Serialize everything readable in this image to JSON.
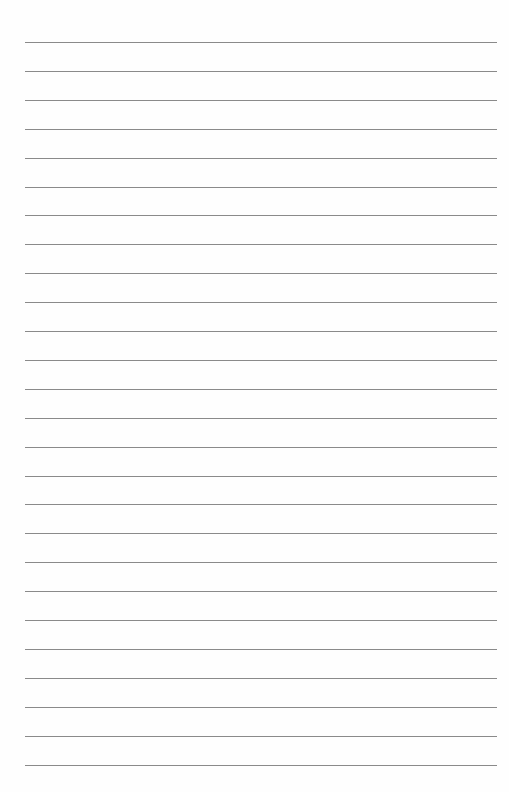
{
  "document": {
    "type": "lined-paper",
    "line_count": 26,
    "first_line_y": 42,
    "line_spacing": 28.9,
    "line_left": 25,
    "line_width": 472,
    "line_color": "#8a8a8a",
    "background_color": "#fefefe"
  }
}
